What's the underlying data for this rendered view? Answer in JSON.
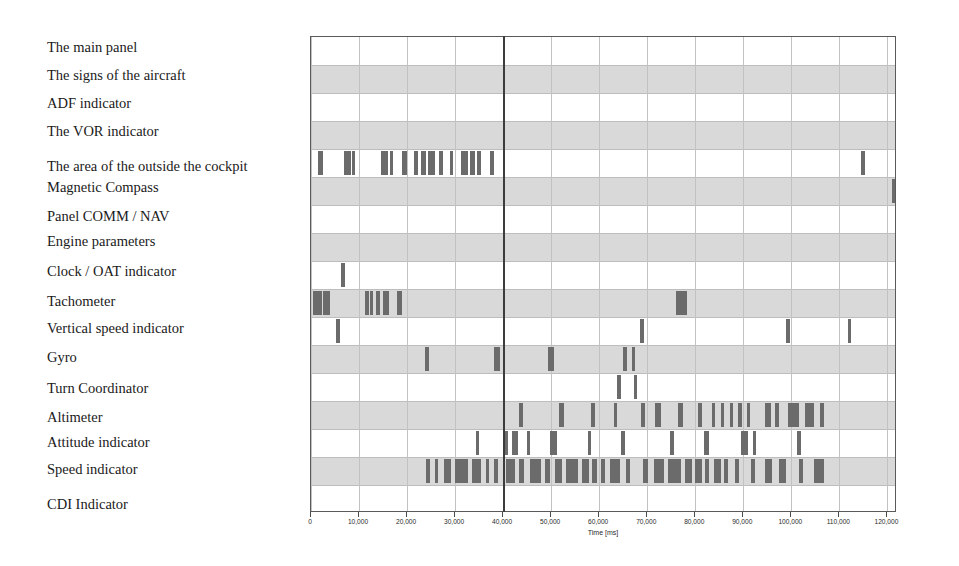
{
  "chart_data": {
    "type": "timeline",
    "title": "",
    "xlabel": "Time [ms]",
    "ylabel": "",
    "xlim": [
      0,
      122000
    ],
    "xticks": [
      0,
      10000,
      20000,
      30000,
      40000,
      50000,
      60000,
      70000,
      80000,
      90000,
      100000,
      110000,
      120000
    ],
    "xtick_labels": [
      "0",
      "10,000",
      "20,000",
      "30,000",
      "40,000",
      "50,000",
      "60,000",
      "70,000",
      "80,000",
      "90,000",
      "100,000",
      "110,000",
      "120,000"
    ],
    "grid": true,
    "legend": "none",
    "cursor_ms": 40000,
    "band_color": "#d2d2d2",
    "mark_color": "#6b6b6b",
    "cursor_color": "#3c3c3c",
    "categories": [
      "The main panel",
      "The signs of the aircraft",
      "ADF indicator",
      "The VOR indicator",
      "The area of the outside the cockpit",
      "Magnetic Compass",
      "Panel COMM / NAV",
      "Engine parameters",
      "Clock / OAT indicator",
      "Tachometer",
      "Vertical speed indicator",
      "Gyro",
      "Turn Coordinator",
      "Altimeter",
      "Attitude indicator",
      "Speed indicator",
      "CDI Indicator"
    ],
    "series": [
      {
        "name": "The main panel",
        "events": []
      },
      {
        "name": "The signs of the aircraft",
        "events": []
      },
      {
        "name": "ADF indicator",
        "events": []
      },
      {
        "name": "The VOR indicator",
        "events": []
      },
      {
        "name": "The area of the outside the cockpit",
        "events": [
          [
            1500,
            900
          ],
          [
            6900,
            1400
          ],
          [
            8500,
            700
          ],
          [
            14500,
            1500
          ],
          [
            16400,
            600
          ],
          [
            19000,
            900
          ],
          [
            21500,
            700
          ],
          [
            23000,
            900
          ],
          [
            24400,
            1400
          ],
          [
            26700,
            800
          ],
          [
            28900,
            700
          ],
          [
            31200,
            1500
          ],
          [
            33200,
            900
          ],
          [
            34600,
            700
          ],
          [
            37300,
            900
          ],
          [
            114500,
            900
          ]
        ]
      },
      {
        "name": "Magnetic Compass",
        "events": [
          [
            120900,
            1200
          ]
        ]
      },
      {
        "name": "Panel COMM / NAV",
        "events": []
      },
      {
        "name": "Engine parameters",
        "events": []
      },
      {
        "name": "Clock / OAT indicator",
        "events": [
          [
            6200,
            900
          ]
        ]
      },
      {
        "name": "Tachometer",
        "events": [
          [
            400,
            900
          ],
          [
            1300,
            900
          ],
          [
            2400,
            900
          ],
          [
            3300,
            700
          ],
          [
            11200,
            900
          ],
          [
            12300,
            700
          ],
          [
            13500,
            900
          ],
          [
            15000,
            1200
          ],
          [
            18000,
            900
          ],
          [
            75900,
            2300
          ]
        ]
      },
      {
        "name": "Vertical speed indicator",
        "events": [
          [
            5300,
            800
          ],
          [
            68500,
            900
          ],
          [
            98900,
            900
          ],
          [
            111700,
            700
          ]
        ]
      },
      {
        "name": "Gyro",
        "events": [
          [
            23800,
            700
          ],
          [
            38200,
            1100
          ],
          [
            49400,
            1100
          ],
          [
            65000,
            700
          ],
          [
            66800,
            600
          ]
        ]
      },
      {
        "name": "Turn Coordinator",
        "events": [
          [
            63800,
            700
          ],
          [
            67300,
            600
          ]
        ]
      },
      {
        "name": "Altimeter",
        "events": [
          [
            43200,
            900
          ],
          [
            51700,
            900
          ],
          [
            58200,
            900
          ],
          [
            63000,
            800
          ],
          [
            68600,
            900
          ],
          [
            71700,
            1200
          ],
          [
            76500,
            900
          ],
          [
            80600,
            700
          ],
          [
            83400,
            700
          ],
          [
            85300,
            700
          ],
          [
            87200,
            700
          ],
          [
            89000,
            700
          ],
          [
            90800,
            700
          ],
          [
            94600,
            1200
          ],
          [
            96700,
            800
          ],
          [
            99400,
            2300
          ],
          [
            102900,
            1800
          ],
          [
            106000,
            700
          ]
        ]
      },
      {
        "name": "Attitude indicator",
        "events": [
          [
            34300,
            700
          ],
          [
            40200,
            800
          ],
          [
            41800,
            1400
          ],
          [
            44900,
            700
          ],
          [
            49700,
            1500
          ],
          [
            57600,
            800
          ],
          [
            64500,
            800
          ],
          [
            74800,
            700
          ],
          [
            81900,
            900
          ],
          [
            89500,
            1400
          ],
          [
            92100,
            600
          ],
          [
            101200,
            900
          ]
        ]
      },
      {
        "name": "Speed indicator",
        "events": [
          [
            23900,
            900
          ],
          [
            25800,
            700
          ],
          [
            27600,
            1600
          ],
          [
            30000,
            2600
          ],
          [
            33500,
            1800
          ],
          [
            36400,
            700
          ],
          [
            38100,
            900
          ],
          [
            40500,
            2000
          ],
          [
            43400,
            900
          ],
          [
            45500,
            2300
          ],
          [
            48800,
            900
          ],
          [
            50800,
            1400
          ],
          [
            53000,
            2600
          ],
          [
            56400,
            1400
          ],
          [
            58600,
            900
          ],
          [
            60400,
            900
          ],
          [
            62300,
            2000
          ],
          [
            65600,
            900
          ],
          [
            69200,
            900
          ],
          [
            71400,
            2000
          ],
          [
            74400,
            2600
          ],
          [
            77900,
            1400
          ],
          [
            80000,
            1400
          ],
          [
            82000,
            900
          ],
          [
            84000,
            1400
          ],
          [
            86000,
            900
          ],
          [
            88300,
            900
          ],
          [
            91500,
            900
          ],
          [
            94600,
            1400
          ],
          [
            97400,
            1400
          ],
          [
            101500,
            900
          ],
          [
            104800,
            1900
          ]
        ]
      },
      {
        "name": "CDI Indicator",
        "events": []
      }
    ]
  },
  "axis": {
    "title": "Time [ms]"
  }
}
